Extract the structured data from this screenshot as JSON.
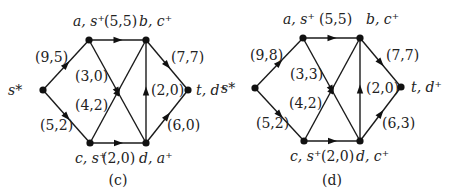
{
  "panels": [
    {
      "id": "c",
      "caption": "(c)",
      "nodes": [
        {
          "id": "s",
          "label": "s*",
          "x": 43,
          "y": 90,
          "lx": 8,
          "ly": 95
        },
        {
          "id": "a",
          "label": "a, s⁺",
          "x": 89,
          "y": 40,
          "lx": 73,
          "ly": 26
        },
        {
          "id": "b",
          "label": "b, c⁺",
          "x": 146,
          "y": 40,
          "lx": 139,
          "ly": 26
        },
        {
          "id": "t",
          "label": "t, d⁺",
          "x": 188,
          "y": 90,
          "lx": 196,
          "ly": 95
        },
        {
          "id": "c",
          "label": "c, s⁺",
          "x": 90,
          "y": 143,
          "lx": 75,
          "ly": 163
        },
        {
          "id": "d",
          "label": "d, a⁺",
          "x": 146,
          "y": 143,
          "lx": 139,
          "ly": 163
        }
      ],
      "edges": [
        {
          "from": "s",
          "to": "a",
          "label": "(9,5)",
          "lx": 35,
          "ly": 62
        },
        {
          "from": "s",
          "to": "c",
          "label": "(5,2)",
          "lx": 40,
          "ly": 130
        },
        {
          "from": "a",
          "to": "b",
          "label": "(5,5)",
          "lx": 104,
          "ly": 26
        },
        {
          "from": "a",
          "to": "d",
          "label": "(3,0)",
          "lx": 75,
          "ly": 81
        },
        {
          "from": "c",
          "to": "b",
          "label": "(4,2)",
          "lx": 75,
          "ly": 110
        },
        {
          "from": "c",
          "to": "d",
          "label": "(2,0)",
          "lx": 102,
          "ly": 163
        },
        {
          "from": "d",
          "to": "b",
          "label": "(2,0)",
          "lx": 151,
          "ly": 95
        },
        {
          "from": "b",
          "to": "t",
          "label": "(7,7)",
          "lx": 171,
          "ly": 62
        },
        {
          "from": "d",
          "to": "t",
          "label": "(6,0)",
          "lx": 167,
          "ly": 130
        }
      ]
    },
    {
      "id": "d",
      "caption": "(d)",
      "nodes": [
        {
          "id": "s",
          "label": "s*",
          "x": 255,
          "y": 88,
          "lx": 221,
          "ly": 93
        },
        {
          "id": "a",
          "label": "a, s⁺",
          "x": 303,
          "y": 38,
          "lx": 283,
          "ly": 24
        },
        {
          "id": "b",
          "label": "b, c⁺",
          "x": 360,
          "y": 38,
          "lx": 366,
          "ly": 24
        },
        {
          "id": "t",
          "label": "t, d⁺",
          "x": 401,
          "y": 87,
          "lx": 411,
          "ly": 92
        },
        {
          "id": "c",
          "label": "c, s⁺",
          "x": 304,
          "y": 141,
          "lx": 290,
          "ly": 161
        },
        {
          "id": "d",
          "label": "d, c⁺",
          "x": 360,
          "y": 141,
          "lx": 356,
          "ly": 161
        }
      ],
      "edges": [
        {
          "from": "s",
          "to": "a",
          "label": "(9,8)",
          "lx": 250,
          "ly": 60
        },
        {
          "from": "s",
          "to": "c",
          "label": "(5,2)",
          "lx": 256,
          "ly": 128
        },
        {
          "from": "a",
          "to": "b",
          "label": "(5,5)",
          "lx": 319,
          "ly": 24
        },
        {
          "from": "a",
          "to": "d",
          "label": "(3,3)",
          "lx": 290,
          "ly": 79
        },
        {
          "from": "c",
          "to": "b",
          "label": "(4,2)",
          "lx": 289,
          "ly": 108
        },
        {
          "from": "c",
          "to": "d",
          "label": "(2,0)",
          "lx": 321,
          "ly": 161
        },
        {
          "from": "d",
          "to": "b",
          "label": "(2,0)",
          "lx": 366,
          "ly": 93
        },
        {
          "from": "b",
          "to": "t",
          "label": "(7,7)",
          "lx": 386,
          "ly": 60
        },
        {
          "from": "d",
          "to": "t",
          "label": "(6,3)",
          "lx": 382,
          "ly": 128
        }
      ]
    }
  ]
}
